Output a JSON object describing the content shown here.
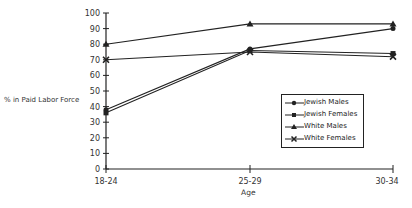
{
  "chart_data": {
    "type": "line",
    "title": "",
    "xlabel": "Age",
    "ylabel": "% in Paid Labor Force",
    "categories": [
      "18-24",
      "25-29",
      "30-34"
    ],
    "ylim": [
      0,
      100
    ],
    "yticks": [
      0,
      10,
      20,
      30,
      40,
      50,
      60,
      70,
      80,
      90,
      100
    ],
    "grid": false,
    "legend_position": "right-center",
    "series": [
      {
        "name": "Jewish Males",
        "marker": "circle",
        "values": [
          38,
          77,
          90
        ]
      },
      {
        "name": "Jewish Females",
        "marker": "square",
        "values": [
          36,
          76,
          74
        ]
      },
      {
        "name": "White Males",
        "marker": "triangle",
        "values": [
          80,
          93,
          93
        ]
      },
      {
        "name": "White Females",
        "marker": "x",
        "values": [
          70,
          75,
          72
        ]
      }
    ]
  },
  "labels": {
    "ylabel": "% in Paid Labor Force",
    "xlabel": "Age",
    "legend": [
      "Jewish Males",
      "Jewish Females",
      "White Males",
      "White Females"
    ]
  }
}
